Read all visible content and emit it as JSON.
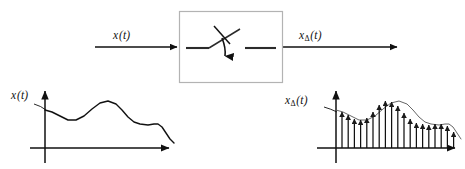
{
  "diagram": {
    "stroke_color": "#111111",
    "box_border_color": "#b3b3b3",
    "background_color": "#ffffff"
  },
  "signal_flow": {
    "input_label": {
      "base": "x",
      "sub": "",
      "arg": "(t)",
      "text": "x(t)"
    },
    "output_label": {
      "base": "x",
      "sub": "Δ",
      "arg": "(t)",
      "text": "xΔ(t)"
    },
    "block": {
      "name": "ideal-sampler",
      "icon": "switch-sampler-icon",
      "x": 179,
      "y": 11,
      "width": 104,
      "height": 72
    },
    "input_arrow": {
      "x1": 95,
      "y1": 47,
      "x2": 180,
      "y2": 47
    },
    "output_arrow": {
      "x1": 283,
      "y1": 47,
      "x2": 400,
      "y2": 47
    }
  },
  "plots": [
    {
      "name": "continuous-signal-plot",
      "label": {
        "base": "x",
        "sub": "",
        "arg": "(t)",
        "text": "x(t)"
      },
      "type": "line",
      "axes": {
        "origin_x": 45,
        "origin_y": 148,
        "x_min": 30,
        "x_max": 172,
        "y_top": 88
      },
      "xlabel": "",
      "ylabel": "",
      "grid": false,
      "curve_points": [
        [
          45,
          110
        ],
        [
          52,
          112
        ],
        [
          60,
          116
        ],
        [
          68,
          120
        ],
        [
          76,
          120
        ],
        [
          84,
          116
        ],
        [
          92,
          109
        ],
        [
          100,
          103
        ],
        [
          108,
          101
        ],
        [
          116,
          104
        ],
        [
          122,
          110
        ],
        [
          128,
          117
        ],
        [
          134,
          122
        ],
        [
          140,
          124
        ],
        [
          148,
          125
        ],
        [
          154,
          124
        ],
        [
          158,
          124
        ],
        [
          162,
          127
        ],
        [
          166,
          133
        ],
        [
          170,
          139
        ],
        [
          174,
          143
        ]
      ]
    },
    {
      "name": "sampled-signal-plot",
      "label": {
        "base": "x",
        "sub": "Δ",
        "arg": "(t)",
        "text": "xΔ(t)"
      },
      "type": "line",
      "axes": {
        "origin_x": 336,
        "origin_y": 148,
        "x_min": 317,
        "x_max": 458,
        "y_top": 88
      },
      "xlabel": "",
      "ylabel": "",
      "grid": false,
      "envelope_points": [
        [
          336,
          110
        ],
        [
          343,
          112
        ],
        [
          351,
          116
        ],
        [
          359,
          120
        ],
        [
          367,
          120
        ],
        [
          375,
          116
        ],
        [
          383,
          109
        ],
        [
          391,
          103
        ],
        [
          399,
          101
        ],
        [
          407,
          104
        ],
        [
          413,
          110
        ],
        [
          419,
          117
        ],
        [
          425,
          122
        ],
        [
          431,
          124
        ],
        [
          439,
          125
        ],
        [
          445,
          124
        ],
        [
          449,
          124
        ],
        [
          453,
          127
        ],
        [
          457,
          133
        ],
        [
          461,
          139
        ]
      ],
      "impulse_spacing": 6.2,
      "impulse_x": [
        342,
        348.2,
        354.4,
        360.6,
        366.8,
        373,
        379.2,
        385.4,
        391.6,
        397.8,
        404,
        410.2,
        416.4,
        422.6,
        428.8,
        435,
        441.2,
        447.4,
        453.6
      ],
      "impulse_heights": [
        36,
        33,
        29,
        28,
        30,
        36,
        43,
        47,
        46,
        42,
        35,
        29,
        25,
        24,
        23,
        24,
        24,
        22,
        16
      ]
    }
  ]
}
